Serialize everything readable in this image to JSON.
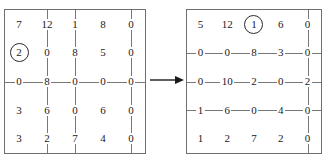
{
  "figure": {
    "arrow": {
      "icon": "right-arrow-icon",
      "label": "→"
    },
    "colors": {
      "border": "#6e6e6e",
      "rule": "#777777",
      "text": "#1a1a1a",
      "background": "#ffffff"
    }
  },
  "matrices": [
    {
      "name": "left-matrix",
      "rows": [
        [
          "7",
          "12",
          "1",
          "8",
          "0"
        ],
        [
          "2",
          "0",
          "8",
          "5",
          "0"
        ],
        [
          "0",
          "8",
          "0",
          "0",
          "0"
        ],
        [
          "3",
          "6",
          "0",
          "6",
          "0"
        ],
        [
          "3",
          "2",
          "7",
          "4",
          "0"
        ]
      ],
      "circled": [
        {
          "row": 1,
          "col": 0
        }
      ],
      "struck_rows": [
        2
      ],
      "struck_cols": [
        1,
        2,
        4
      ]
    },
    {
      "name": "right-matrix",
      "rows": [
        [
          "5",
          "12",
          "1",
          "6",
          "0"
        ],
        [
          "0",
          "0",
          "8",
          "3",
          "0"
        ],
        [
          "0",
          "10",
          "2",
          "0",
          "2"
        ],
        [
          "1",
          "6",
          "0",
          "4",
          "0"
        ],
        [
          "1",
          "2",
          "7",
          "2",
          "0"
        ]
      ],
      "circled": [
        {
          "row": 0,
          "col": 2
        }
      ],
      "struck_rows": [
        1,
        2,
        3
      ],
      "struck_cols": [
        4
      ]
    }
  ]
}
